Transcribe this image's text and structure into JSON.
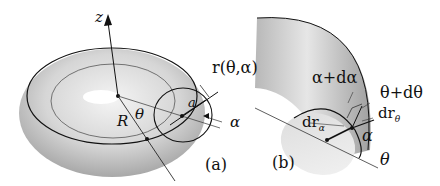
{
  "figure": {
    "panel_a": {
      "caption": "(a)",
      "labels": {
        "z_axis": "z",
        "position_vector": "r(θ,α)",
        "major_radius": "R",
        "toroidal_angle": "θ",
        "minor_radius": "a",
        "poloidal_angle": "α"
      }
    },
    "panel_b": {
      "caption": "(b)",
      "labels": {
        "alpha_plus": "α+dα",
        "theta_plus": "θ+dθ",
        "dr_theta": "dr",
        "dr_theta_sub": "θ",
        "dr_alpha": "dr",
        "dr_alpha_sub": "α",
        "alpha": "α",
        "theta": "θ"
      }
    },
    "colors": {
      "surface_light": "#f2f2f2",
      "surface_mid": "#cfcfcf",
      "surface_dark": "#9a9a9a",
      "line": "#111111"
    }
  }
}
